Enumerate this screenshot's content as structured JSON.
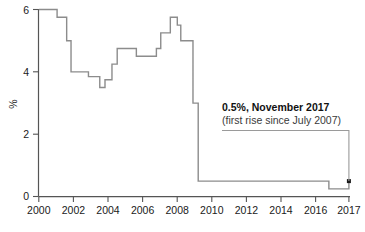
{
  "chart_data": {
    "type": "line",
    "title": "",
    "subtitle": "",
    "xlabel": "",
    "ylabel": "%",
    "xlim": [
      2000,
      2017.95
    ],
    "ylim": [
      0,
      6.2
    ],
    "grid": false,
    "legend": false,
    "legend_position": "none",
    "x_ticks": [
      2000,
      2002,
      2004,
      2006,
      2008,
      2010,
      2012,
      2014,
      2016,
      2017
    ],
    "x_tick_labels": [
      "2000",
      "2002",
      "2004",
      "2006",
      "2008",
      "2010",
      "2012",
      "2014",
      "2016",
      "2017"
    ],
    "y_ticks": [
      0,
      2,
      4,
      6
    ],
    "y_tick_labels": [
      "0",
      "2",
      "4",
      "6"
    ],
    "series": [
      {
        "name": "Bank rate",
        "color": "#8c8c8c",
        "step": true,
        "points": [
          {
            "x": 2000.0,
            "y": 6.0
          },
          {
            "x": 2000.9,
            "y": 6.0
          },
          {
            "x": 2001.05,
            "y": 5.75
          },
          {
            "x": 2001.6,
            "y": 5.0
          },
          {
            "x": 2001.85,
            "y": 4.0
          },
          {
            "x": 2002.0,
            "y": 4.0
          },
          {
            "x": 2002.8,
            "y": 4.0
          },
          {
            "x": 2002.85,
            "y": 3.85
          },
          {
            "x": 2003.1,
            "y": 3.85
          },
          {
            "x": 2003.5,
            "y": 3.5
          },
          {
            "x": 2003.8,
            "y": 3.75
          },
          {
            "x": 2004.2,
            "y": 4.25
          },
          {
            "x": 2004.5,
            "y": 4.75
          },
          {
            "x": 2005.2,
            "y": 4.75
          },
          {
            "x": 2005.6,
            "y": 4.5
          },
          {
            "x": 2006.5,
            "y": 4.5
          },
          {
            "x": 2006.75,
            "y": 4.75
          },
          {
            "x": 2007.0,
            "y": 5.25
          },
          {
            "x": 2007.55,
            "y": 5.75
          },
          {
            "x": 2007.95,
            "y": 5.5
          },
          {
            "x": 2008.15,
            "y": 5.0
          },
          {
            "x": 2008.75,
            "y": 5.0
          },
          {
            "x": 2008.85,
            "y": 3.0
          },
          {
            "x": 2009.15,
            "y": 0.5
          },
          {
            "x": 2016.5,
            "y": 0.5
          },
          {
            "x": 2016.65,
            "y": 0.25
          },
          {
            "x": 2017.55,
            "y": 0.25
          },
          {
            "x": 2017.8,
            "y": 0.5
          }
        ]
      }
    ],
    "markers": [
      {
        "x": 2017.8,
        "y": 0.5,
        "color": "#1a1a1a"
      }
    ],
    "annotations": [
      {
        "title": "0.5%, November 2017",
        "detail": "(first rise since July 2007)",
        "value": 0.5,
        "year": 2017,
        "month": "November",
        "leader_color": "#9a9a9a"
      }
    ]
  },
  "axis": {
    "y_title": "%",
    "line_color": "#555555"
  }
}
